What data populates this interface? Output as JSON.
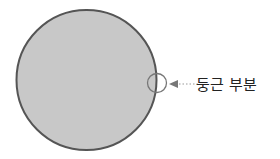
{
  "diagram": {
    "shapes": [
      {
        "name": "main-circle",
        "icon": "circle",
        "fill": "#c8c8c8",
        "stroke": "#555555"
      },
      {
        "name": "highlight-circle",
        "icon": "circle-outline",
        "stroke": "#777777"
      }
    ],
    "arrow": {
      "style": "dotted",
      "direction": "left",
      "color": "#888888"
    },
    "label": "둥근 부분"
  }
}
